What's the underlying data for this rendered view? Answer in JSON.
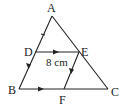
{
  "diagram": {
    "type": "geometry-triangle",
    "points": {
      "A": {
        "label": "A",
        "x": 52,
        "y": 16
      },
      "B": {
        "label": "B",
        "x": 19,
        "y": 89
      },
      "C": {
        "label": "C",
        "x": 108,
        "y": 89
      },
      "D": {
        "label": "D",
        "x": 35,
        "y": 52
      },
      "E": {
        "label": "E",
        "x": 79,
        "y": 52
      },
      "F": {
        "label": "F",
        "x": 64,
        "y": 89
      }
    },
    "segments": [
      {
        "from": "A",
        "to": "B"
      },
      {
        "from": "A",
        "to": "C"
      },
      {
        "from": "B",
        "to": "C"
      },
      {
        "from": "D",
        "to": "E"
      },
      {
        "from": "E",
        "to": "F"
      }
    ],
    "measurement": {
      "segment": "DE",
      "text": "8 cm"
    },
    "parallel_marks": [
      {
        "pair": [
          "DE",
          "BC"
        ],
        "marker": "single-arrow"
      },
      {
        "pair": [
          "DB",
          "EF"
        ],
        "marker": "single-arrow"
      }
    ],
    "equal_tick": {
      "segment": "AD",
      "marker": "tick"
    },
    "colors": {
      "stroke": "#222222",
      "background": "#ffffff"
    }
  }
}
